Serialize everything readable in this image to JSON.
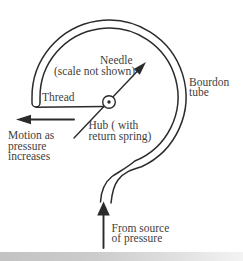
{
  "diagram": {
    "labels": {
      "needle": [
        "Needle",
        "(scale not shown)"
      ],
      "thread": [
        "Thread"
      ],
      "hub": [
        "Hub ( with",
        "return spring)"
      ],
      "bourdon_tube": [
        "Bourdon",
        "tube"
      ],
      "motion": [
        "Motion as",
        "pressure",
        "increases"
      ],
      "pressure_source": [
        "From source",
        "of pressure"
      ]
    },
    "arrows": {
      "needle": "up-right from hub",
      "motion": "left",
      "pressure_source": "up into tube inlet"
    },
    "colors": {
      "ink": "#2b2b2b",
      "text": "#414141",
      "background": "#ffffff"
    }
  }
}
